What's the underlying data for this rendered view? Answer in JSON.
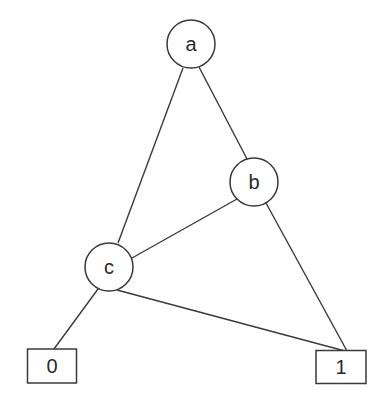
{
  "diagram": {
    "type": "binary-decision-diagram",
    "nodes": [
      {
        "id": "a",
        "label": "a",
        "kind": "decision"
      },
      {
        "id": "b",
        "label": "b",
        "kind": "decision"
      },
      {
        "id": "c",
        "label": "c",
        "kind": "decision"
      },
      {
        "id": "t0",
        "label": "0",
        "kind": "terminal"
      },
      {
        "id": "t1",
        "label": "1",
        "kind": "terminal"
      }
    ],
    "edges": [
      {
        "from": "a",
        "to": "c"
      },
      {
        "from": "a",
        "to": "b"
      },
      {
        "from": "b",
        "to": "c"
      },
      {
        "from": "b",
        "to": "t1"
      },
      {
        "from": "c",
        "to": "t0"
      },
      {
        "from": "c",
        "to": "t1"
      }
    ]
  }
}
